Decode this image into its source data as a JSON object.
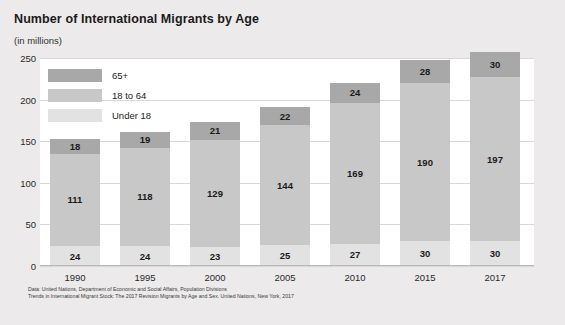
{
  "header": {
    "title": "Number of International Migrants by Age",
    "subtitle": "(in millions)"
  },
  "legend": {
    "items": [
      {
        "label": "65+",
        "color": "#a8a8a8"
      },
      {
        "label": "18 to 64",
        "color": "#c8c8c8"
      },
      {
        "label": "Under 18",
        "color": "#e2e2e2"
      }
    ]
  },
  "source": {
    "line1": "Data: United Nations, Department of Economic and Social Affairs, Population Divisions",
    "line2": "Trends in International Migrant Stock: The 2017 Revision Migrants by Age and Sex. United Nations, New York, 2017"
  },
  "chart_data": {
    "type": "bar",
    "title": "Number of International Migrants by Age",
    "subtitle": "(in millions)",
    "stacked": true,
    "xlabel": "",
    "ylabel": "(in millions)",
    "ylim": [
      0,
      250
    ],
    "yticks": [
      0,
      50,
      100,
      150,
      200,
      250
    ],
    "grid": true,
    "legend_position": "top-left",
    "categories": [
      "1990",
      "1995",
      "2000",
      "2005",
      "2010",
      "2015",
      "2017"
    ],
    "series": [
      {
        "name": "Under 18",
        "color": "#e2e2e2",
        "values": [
          24,
          24,
          23,
          25,
          27,
          30,
          30
        ]
      },
      {
        "name": "18 to 64",
        "color": "#c8c8c8",
        "values": [
          111,
          118,
          129,
          144,
          169,
          190,
          197
        ]
      },
      {
        "name": "65+",
        "color": "#a8a8a8",
        "values": [
          18,
          19,
          21,
          22,
          24,
          28,
          30
        ]
      }
    ],
    "totals": [
      153,
      161,
      173,
      191,
      220,
      248,
      257
    ]
  }
}
